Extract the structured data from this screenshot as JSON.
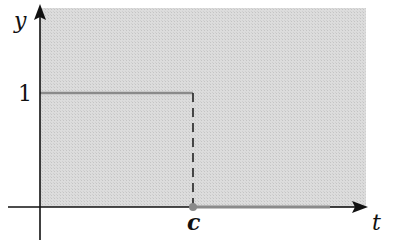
{
  "diagram": {
    "axes": {
      "x_label": "t",
      "y_label": "y",
      "y_tick_label": "1",
      "x_tick_label": "c"
    },
    "function": {
      "type": "step",
      "segments": [
        {
          "from": "0",
          "to": "c",
          "value": 1,
          "style": "solid-gray"
        },
        {
          "from": "c",
          "to": "inf",
          "value": 0,
          "style": "solid-gray"
        }
      ],
      "discontinuity_at": "c",
      "drop_line_style": "dashed"
    },
    "colors": {
      "background_shade": "#d6d6d6",
      "axis": "#111111",
      "curve": "#8a8a8a"
    }
  }
}
